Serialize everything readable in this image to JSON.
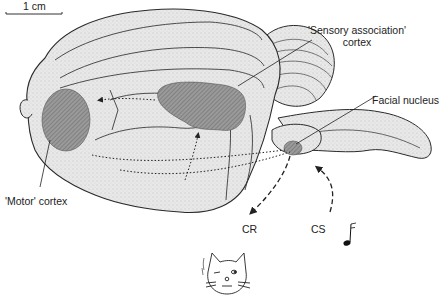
{
  "scale_bar": {
    "label": "1 cm"
  },
  "labels": {
    "sensory_line1": "'Sensory association'",
    "sensory_line2": "cortex",
    "facial_nucleus": "Facial nucleus",
    "motor_cortex": "'Motor' cortex",
    "cr": "CR",
    "cs": "CS"
  },
  "icons": {
    "stimulus": "musical-note-icon",
    "subject": "winking-cat-icon"
  },
  "colors": {
    "brain_fill": "#e6e6e6",
    "outline": "#2a2a2a",
    "hatched_region": "#8a8a8a",
    "background": "#ffffff"
  }
}
